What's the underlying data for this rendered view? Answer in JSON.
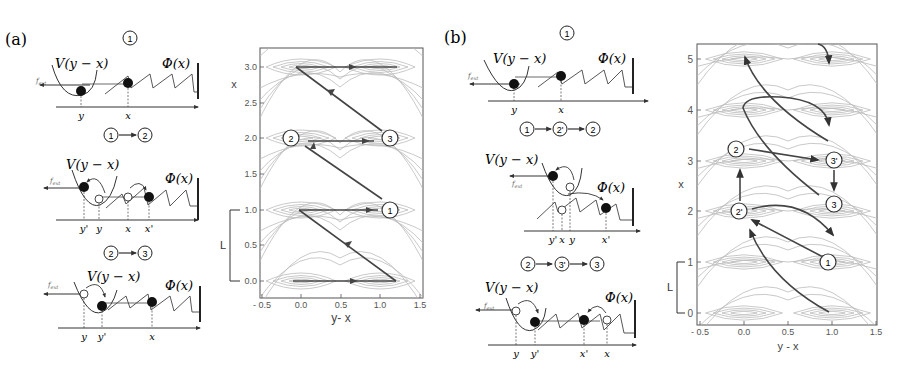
{
  "figure": {
    "panel_a": {
      "label": "(a)",
      "schematics": [
        {
          "step": "1",
          "title_nodes": [
            "1"
          ],
          "potential_label": "V(y − x)",
          "substrate_label": "Φ(x)",
          "force_label": "f_ext",
          "axis_ticks": [
            "y",
            "x"
          ]
        },
        {
          "step": "1→2",
          "title_nodes": [
            "1",
            "2"
          ],
          "potential_label": "V(y − x)",
          "substrate_label": "Φ(x)",
          "force_label": "f_ext",
          "axis_ticks": [
            "y'",
            "y",
            "x",
            "x'"
          ]
        },
        {
          "step": "2→3",
          "title_nodes": [
            "2",
            "3"
          ],
          "potential_label": "V(y − x)",
          "substrate_label": "Φ(x)",
          "force_label": "f_ext",
          "axis_ticks": [
            "y",
            "y'",
            "x"
          ]
        }
      ],
      "plot": {
        "xlabel": "y- x",
        "ylabel": "x",
        "xticks": [
          "- 0.5",
          "0.0",
          "0.5",
          "1.0",
          "1.5"
        ],
        "yticks": [
          "0.0",
          "0.5",
          "1.0",
          "1.5",
          "2.0",
          "2.5",
          "3.0"
        ],
        "bracket_label": "L",
        "state_markers": [
          {
            "label": "1",
            "x": 1.1,
            "y": 1.0
          },
          {
            "label": "2",
            "x": -0.1,
            "y": 2.0
          },
          {
            "label": "3",
            "x": 1.1,
            "y": 2.0
          }
        ]
      }
    },
    "panel_b": {
      "label": "(b)",
      "schematics": [
        {
          "step": "1",
          "title_nodes": [
            "1"
          ],
          "potential_label": "V(y − x)",
          "substrate_label": "Φ(x)",
          "force_label": "f_ext",
          "axis_ticks": [
            "y",
            "x"
          ]
        },
        {
          "step": "1→2'→2",
          "title_nodes": [
            "1",
            "2'",
            "2"
          ],
          "potential_label": "V(y − x)",
          "substrate_label": "Φ(x)",
          "force_label": "f_ext",
          "axis_ticks": [
            "y'",
            "x",
            "y",
            "x'"
          ]
        },
        {
          "step": "2→3'→3",
          "title_nodes": [
            "2",
            "3'",
            "3"
          ],
          "potential_label": "V(y − x)",
          "substrate_label": "Φ(x)",
          "force_label": "f_ext",
          "axis_ticks": [
            "y",
            "y'",
            "x'",
            "x"
          ]
        }
      ],
      "plot": {
        "xlabel": "y - x",
        "ylabel": "x",
        "xticks": [
          "- 0.5",
          "0.0",
          "0.5",
          "1.0",
          "1.5"
        ],
        "yticks": [
          "0",
          "1",
          "2",
          "3",
          "4",
          "5"
        ],
        "bracket_label": "L",
        "state_markers": [
          {
            "label": "1",
            "x": 1.0,
            "y": 1.0
          },
          {
            "label": "2'",
            "x": -0.05,
            "y": 2.0
          },
          {
            "label": "2",
            "x": -0.05,
            "y": 3.0
          },
          {
            "label": "3'",
            "x": 1.0,
            "y": 3.0
          },
          {
            "label": "3",
            "x": 1.0,
            "y": 2.0
          }
        ]
      }
    },
    "colors": {
      "contour": "#b8b8b8",
      "arrow": "#444444",
      "ink": "#222222",
      "background": "#ffffff"
    }
  }
}
